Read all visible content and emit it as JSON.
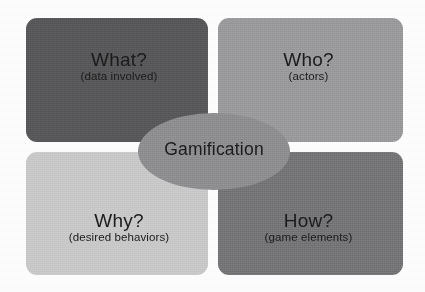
{
  "diagram": {
    "type": "four-quadrant-hub-diagram",
    "background_color": "#fcfcfc",
    "hub": {
      "label": "Gamification",
      "shape": "ellipse",
      "fill_color": "#8e8e90",
      "text_color": "#1b1b1b"
    },
    "quadrants": [
      {
        "position": "top-left",
        "title": "What?",
        "subtitle": "(data involved)",
        "fill_color": "#58585a",
        "text_color": "#1b1b1b"
      },
      {
        "position": "top-right",
        "title": "Who?",
        "subtitle": "(actors)",
        "fill_color": "#9a9a9c",
        "text_color": "#1b1b1b"
      },
      {
        "position": "bottom-left",
        "title": "Why?",
        "subtitle": "(desired behaviors)",
        "fill_color": "#c8c8c8",
        "text_color": "#1b1b1b"
      },
      {
        "position": "bottom-right",
        "title": "How?",
        "subtitle": "(game elements)",
        "fill_color": "#757577",
        "text_color": "#1b1b1b"
      }
    ]
  }
}
